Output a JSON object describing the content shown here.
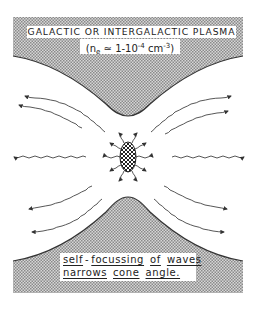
{
  "figure": {
    "top_label": {
      "line1": "GALACTIC OR INTERGALACTIC PLASMA",
      "line2_prefix": "(n",
      "line2_sub": "e",
      "line2_mid": " ≃ 1-10",
      "line2_sup1": "-4",
      "line2_unit": " cm",
      "line2_sup2": "-3",
      "line2_suffix": ")"
    },
    "bottom_label": {
      "line1_words": [
        "self",
        "-",
        "focussing",
        "of",
        "waves"
      ],
      "line2_words": [
        "narrows",
        "cone",
        "angle."
      ]
    },
    "colors": {
      "plasma_fill": "#b8b8b8",
      "line": "#333333",
      "background": "#ffffff"
    },
    "elements": {
      "source": "central-hatched-ellipse",
      "wave_arrows": "wavy-arrows-radiating"
    }
  }
}
